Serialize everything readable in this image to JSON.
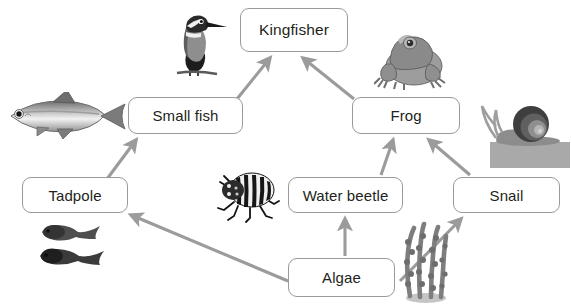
{
  "diagram": {
    "type": "food-web",
    "background_color": "#ffffff",
    "box": {
      "fill": "#ffffff",
      "border_color": "#9a9a9a",
      "text_color": "#231f20"
    },
    "arrow_color": "#9b9b9b",
    "nodes": [
      {
        "id": "kingfisher",
        "label": "Kingfisher",
        "level": "top",
        "icon": "kingfisher-bird-illustration"
      },
      {
        "id": "smallfish",
        "label": "Small fish",
        "level": "upper",
        "icon": "fish-illustration"
      },
      {
        "id": "frog",
        "label": "Frog",
        "level": "upper",
        "icon": "frog-illustration"
      },
      {
        "id": "tadpole",
        "label": "Tadpole",
        "level": "middle",
        "icon": "tadpoles-illustration"
      },
      {
        "id": "waterbeetle",
        "label": "Water beetle",
        "level": "middle",
        "icon": "beetle-illustration"
      },
      {
        "id": "snail",
        "label": "Snail",
        "level": "middle",
        "icon": "snail-illustration"
      },
      {
        "id": "algae",
        "label": "Algae",
        "level": "producer",
        "icon": "algae-illustration"
      }
    ],
    "edges": [
      {
        "from": "smallfish",
        "to": "kingfisher"
      },
      {
        "from": "frog",
        "to": "kingfisher"
      },
      {
        "from": "tadpole",
        "to": "smallfish"
      },
      {
        "from": "waterbeetle",
        "to": "frog"
      },
      {
        "from": "snail",
        "to": "frog"
      },
      {
        "from": "algae",
        "to": "waterbeetle"
      },
      {
        "from": "algae",
        "to": "tadpole"
      },
      {
        "from": "algae",
        "to": "snail"
      }
    ]
  }
}
